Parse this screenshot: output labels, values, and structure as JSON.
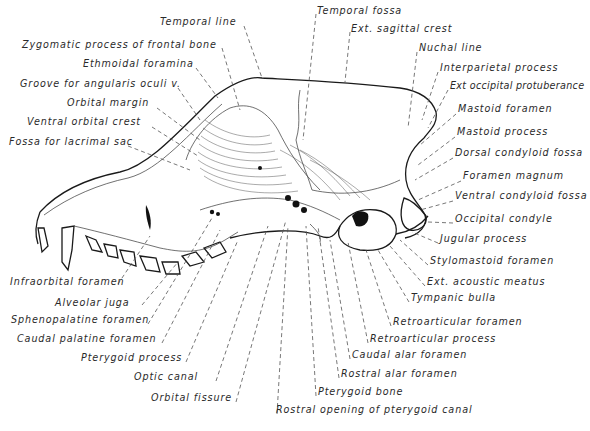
{
  "figure": {
    "labels_top_left": [
      {
        "text": "Temporal line",
        "x": 160,
        "y": 21
      },
      {
        "text": "Zygomatic process of frontal bone",
        "x": 22,
        "y": 44
      },
      {
        "text": "Ethmoidal foramina",
        "x": 83,
        "y": 63
      },
      {
        "text": "Groove for angularis oculi v.",
        "x": 20,
        "y": 83
      },
      {
        "text": "Orbital margin",
        "x": 67,
        "y": 102
      },
      {
        "text": "Ventral orbital crest",
        "x": 27,
        "y": 121
      },
      {
        "text": "Fossa for lacrimal sac",
        "x": 9,
        "y": 141
      }
    ],
    "labels_top_right": [
      {
        "text": "Temporal fossa",
        "x": 317,
        "y": 10
      },
      {
        "text": "Ext. sagittal crest",
        "x": 351,
        "y": 27
      },
      {
        "text": "Nuchal line",
        "x": 419,
        "y": 47
      },
      {
        "text": "Interparietal process",
        "x": 440,
        "y": 67
      },
      {
        "text": "Ext occipital protuberance",
        "x": 450,
        "y": 84
      },
      {
        "text": "Mastoid foramen",
        "x": 458,
        "y": 108
      },
      {
        "text": "Mastoid process",
        "x": 457,
        "y": 131
      },
      {
        "text": "Dorsal condyloid fossa",
        "x": 455,
        "y": 152
      },
      {
        "text": "Foramen magnum",
        "x": 463,
        "y": 175
      },
      {
        "text": "Ventral condyloid fossa",
        "x": 455,
        "y": 195
      },
      {
        "text": "Occipital condyle",
        "x": 455,
        "y": 218
      },
      {
        "text": "Jugular process",
        "x": 440,
        "y": 238
      },
      {
        "text": "Stylomastoid foramen",
        "x": 430,
        "y": 260
      },
      {
        "text": "Ext. acoustic meatus",
        "x": 427,
        "y": 281
      },
      {
        "text": "Tympanic bulla",
        "x": 411,
        "y": 297
      }
    ],
    "labels_bottom_left": [
      {
        "text": "Infraorbital foramen",
        "x": 10,
        "y": 281
      },
      {
        "text": "Alveolar juga",
        "x": 55,
        "y": 302
      },
      {
        "text": "Sphenopalatine foramen",
        "x": 11,
        "y": 319
      },
      {
        "text": "Caudal palatine foramen",
        "x": 17,
        "y": 338
      },
      {
        "text": "Pterygoid process",
        "x": 81,
        "y": 357
      },
      {
        "text": "Optic canal",
        "x": 134,
        "y": 376
      },
      {
        "text": "Orbital fissure",
        "x": 151,
        "y": 397
      }
    ],
    "labels_bottom_right": [
      {
        "text": "Retroarticular foramen",
        "x": 393,
        "y": 321
      },
      {
        "text": "Retroarticular process",
        "x": 370,
        "y": 338
      },
      {
        "text": "Caudal alar foramen",
        "x": 352,
        "y": 354
      },
      {
        "text": "Rostral alar foramen",
        "x": 341,
        "y": 373
      },
      {
        "text": "Pterygoid bone",
        "x": 318,
        "y": 391
      },
      {
        "text": "Rostral opening of pterygoid canal",
        "x": 276,
        "y": 409
      }
    ]
  }
}
